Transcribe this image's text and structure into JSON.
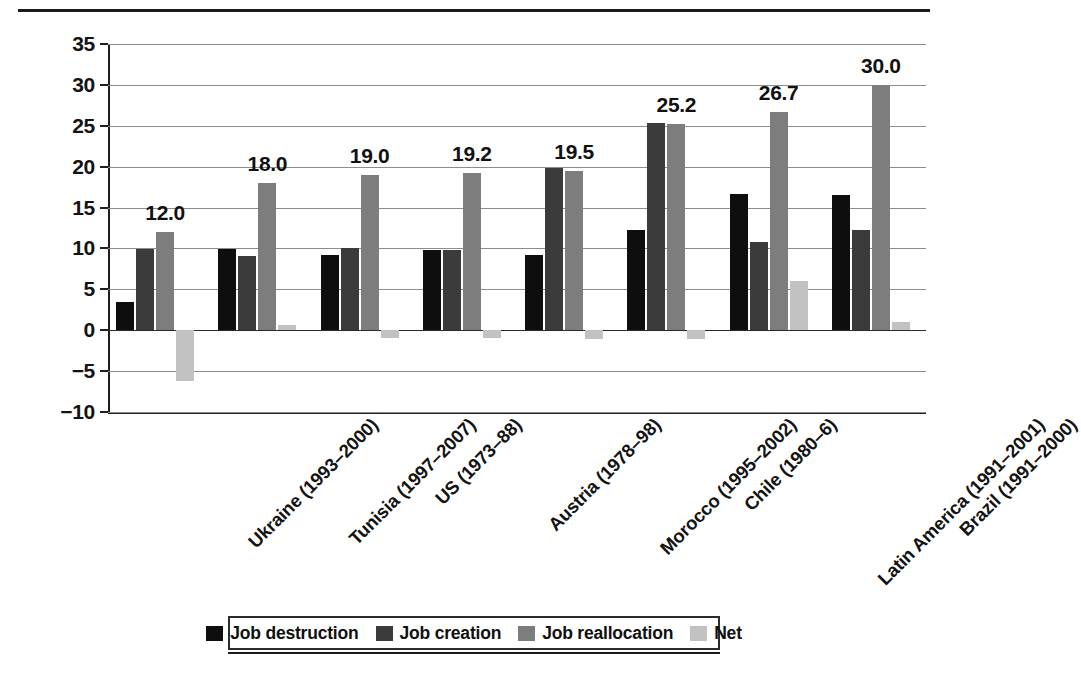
{
  "chart_data": {
    "type": "bar",
    "title": "",
    "xlabel": "",
    "ylabel": "",
    "ylim": [
      -10,
      35
    ],
    "yticks": [
      "35",
      "30",
      "25",
      "20",
      "15",
      "10",
      "5",
      "0",
      "−5",
      "−10"
    ],
    "ytick_values": [
      35,
      30,
      25,
      20,
      15,
      10,
      5,
      0,
      -5,
      -10
    ],
    "grid": true,
    "legend_position": "bottom",
    "categories": [
      "Ukraine (1993–2000)",
      "Tunisia (1997–2007)",
      "US (1973–88)",
      "Austria (1978–98)",
      "Morocco (1995–2002)",
      "Chile (1980–6)",
      "Latin America (1991–2001)",
      "Brazil (1991–2000)"
    ],
    "series": [
      {
        "name": "Job destruction",
        "color": "#0e0e0e",
        "values": [
          3.4,
          9.9,
          9.2,
          9.8,
          9.2,
          12.2,
          16.6,
          16.5
        ]
      },
      {
        "name": "Job creation",
        "color": "#3b3b3b",
        "values": [
          9.9,
          9.1,
          10.1,
          9.8,
          19.8,
          25.4,
          10.8,
          12.2
        ]
      },
      {
        "name": "Job reallocation",
        "color": "#7d7d7d",
        "values": [
          12.0,
          18.0,
          19.0,
          19.2,
          19.5,
          25.2,
          26.7,
          30.0
        ]
      },
      {
        "name": "Net",
        "color": "#c2c2c2",
        "values": [
          -6.2,
          0.6,
          -1.0,
          -0.9,
          -1.1,
          -1.1,
          6.0,
          1.0
        ]
      }
    ],
    "data_labels": {
      "series": "Job reallocation",
      "values": [
        "12.0",
        "18.0",
        "19.0",
        "19.2",
        "19.5",
        "25.2",
        "26.7",
        "30.0"
      ]
    }
  },
  "legend": {
    "items": [
      {
        "label": "Job destruction",
        "color": "#0e0e0e"
      },
      {
        "label": "Job creation",
        "color": "#3b3b3b"
      },
      {
        "label": "Job reallocation",
        "color": "#7d7d7d"
      },
      {
        "label": "Net",
        "color": "#c2c2c2"
      }
    ]
  }
}
